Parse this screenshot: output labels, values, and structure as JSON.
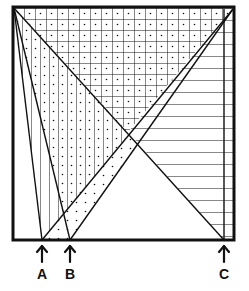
{
  "figure": {
    "type": "geometric-diagram",
    "colors": {
      "ink": "#111111",
      "background": "#ffffff"
    },
    "box": {
      "x": 12,
      "y": 6,
      "width": 223,
      "height": 234
    },
    "points": [
      {
        "id": "A",
        "label": "A",
        "x": 42,
        "y": 240
      },
      {
        "id": "B",
        "label": "B",
        "x": 70,
        "y": 240
      },
      {
        "id": "C",
        "label": "C",
        "x": 224,
        "y": 240
      }
    ]
  },
  "labels": {
    "a": "A",
    "b": "B",
    "c": "C"
  }
}
